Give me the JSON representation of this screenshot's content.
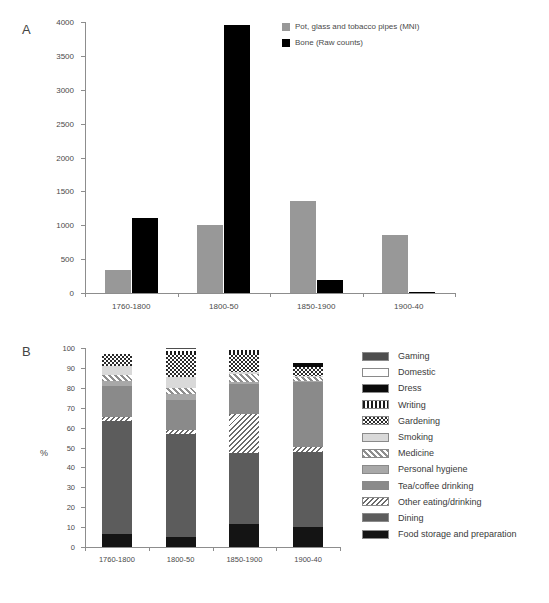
{
  "figure": {
    "panel_a_letter": "A",
    "panel_b_letter": "B"
  },
  "chart_data": [
    {
      "id": "panel_a",
      "type": "bar",
      "title": "",
      "xlabel": "",
      "ylabel": "",
      "ylim": [
        0,
        4000
      ],
      "yticks": [
        0,
        500,
        1000,
        1500,
        2000,
        2500,
        3000,
        3500,
        4000
      ],
      "ytick_labels": [
        "0",
        "500",
        "1000",
        "1500",
        "2000",
        "2500",
        "3000",
        "3500",
        "4000"
      ],
      "grid": false,
      "legend_position": "top-right",
      "categories": [
        "1760-1800",
        "1800-50",
        "1850-1900",
        "1900-40"
      ],
      "series": [
        {
          "name": "Pot, glass and tobacco pipes (MNI)",
          "color": "#989898",
          "values": [
            340,
            1010,
            1355,
            855
          ]
        },
        {
          "name": "Bone (Raw counts)",
          "color": "#000000",
          "values": [
            1105,
            3950,
            185,
            10
          ]
        }
      ]
    },
    {
      "id": "panel_b",
      "type": "bar",
      "subtype": "stacked-percent",
      "title": "",
      "xlabel": "",
      "ylabel": "%",
      "ylim": [
        0,
        100
      ],
      "yticks": [
        0,
        10,
        20,
        30,
        40,
        50,
        60,
        70,
        80,
        90,
        100
      ],
      "ytick_labels": [
        "0",
        "10",
        "20",
        "30",
        "40",
        "50",
        "60",
        "70",
        "80",
        "90",
        "100"
      ],
      "grid": false,
      "legend_position": "right",
      "categories": [
        "1760-1800",
        "1800-50",
        "1850-1900",
        "1900-40"
      ],
      "series": [
        {
          "name": "Gaming",
          "swatch": "gaming",
          "values": [
            0.0,
            0.5,
            0.0,
            0.0
          ]
        },
        {
          "name": "Domestic",
          "swatch": "domestic",
          "values": [
            3.0,
            0.8,
            0.8,
            7.5
          ]
        },
        {
          "name": "Dress",
          "swatch": "dress",
          "values": [
            0.0,
            0.0,
            0.0,
            2.0
          ]
        },
        {
          "name": "Writing",
          "swatch": "writing",
          "values": [
            0.0,
            2.2,
            2.5,
            0.0
          ]
        },
        {
          "name": "Gardening",
          "swatch": "gardening",
          "values": [
            6.0,
            11.0,
            8.7,
            4.5
          ]
        },
        {
          "name": "Smoking",
          "swatch": "smoking",
          "values": [
            4.5,
            5.5,
            0.8,
            0.5
          ]
        },
        {
          "name": "Medicine",
          "swatch": "medicine",
          "values": [
            3.0,
            3.0,
            4.5,
            2.0
          ]
        },
        {
          "name": "Personal hygiene",
          "swatch": "hygiene",
          "values": [
            2.5,
            3.0,
            1.0,
            0.5
          ]
        },
        {
          "name": "Tea/coffee drinking",
          "swatch": "tea",
          "values": [
            15.5,
            15.0,
            15.0,
            32.5
          ]
        },
        {
          "name": "Other eating/drinking",
          "swatch": "othereat",
          "values": [
            2.0,
            2.0,
            19.5,
            2.5
          ]
        },
        {
          "name": "Dining",
          "swatch": "dining",
          "values": [
            57.0,
            52.0,
            35.5,
            38.0
          ]
        },
        {
          "name": "Food storage and preparation",
          "swatch": "foodstorage",
          "values": [
            6.5,
            5.0,
            11.7,
            10.0
          ]
        }
      ]
    }
  ]
}
